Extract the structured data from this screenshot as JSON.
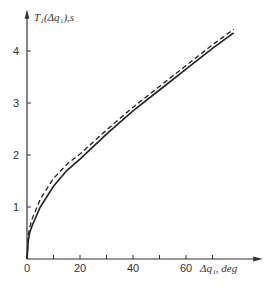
{
  "chart_data": {
    "type": "line",
    "title": "",
    "xlabel": "Δq₁, deg",
    "ylabel": "T₁(Δq₁), s",
    "xlim": [
      0,
      80
    ],
    "ylim": [
      0,
      4.6
    ],
    "x_ticks": [
      0,
      10,
      20,
      30,
      40,
      50,
      60,
      70
    ],
    "x_tick_labels": [
      "0",
      "20",
      "40",
      "60"
    ],
    "y_ticks": [
      1,
      2,
      3,
      4
    ],
    "y_tick_labels": [
      "1",
      "2",
      "3",
      "4"
    ],
    "grid": false,
    "legend": null,
    "series": [
      {
        "name": "solid",
        "style": "solid",
        "x": [
          0,
          0.5,
          1,
          2,
          5,
          10,
          15,
          20,
          30,
          40,
          50,
          60,
          70,
          78
        ],
        "y": [
          0,
          0.35,
          0.5,
          0.65,
          1.0,
          1.4,
          1.7,
          1.92,
          2.4,
          2.85,
          3.25,
          3.65,
          4.05,
          4.35
        ]
      },
      {
        "name": "dashed",
        "style": "dashed",
        "x": [
          0,
          0.5,
          1,
          2,
          5,
          10,
          15,
          20,
          30,
          40,
          50,
          60,
          70,
          78
        ],
        "y": [
          0,
          0.45,
          0.6,
          0.78,
          1.15,
          1.55,
          1.82,
          2.02,
          2.48,
          2.92,
          3.32,
          3.72,
          4.12,
          4.42
        ]
      }
    ]
  },
  "labels": {
    "y_axis": "T₁(Δq₁),s",
    "x_axis": "Δq₁, deg",
    "x_ticks": [
      "0",
      "20",
      "40",
      "60"
    ],
    "y_ticks": [
      "1",
      "2",
      "3",
      "4"
    ]
  }
}
